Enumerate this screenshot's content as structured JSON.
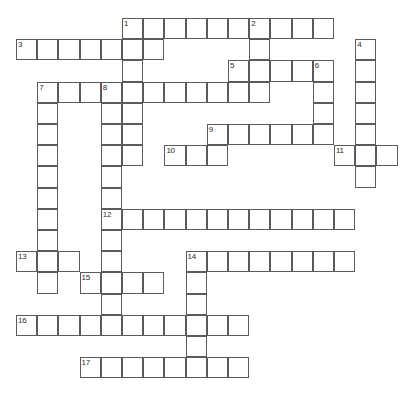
{
  "puzzle": {
    "kind": "crossword-grid",
    "title": "Crossword Puzzle Grid",
    "cell_size": 21.2,
    "origin_x": 16,
    "origin_y": 18,
    "grid_cols": 19,
    "grid_rows": 17,
    "cell_border_color": "#5b5b5b",
    "cell_fill_color": "#ffffff",
    "background_color": "#ffffff",
    "number_color": "#2b2b2b",
    "entries": [
      {
        "number": "1",
        "direction": "across",
        "col": 5,
        "row": 0,
        "length": 10
      },
      {
        "number": "1",
        "direction": "down",
        "col": 5,
        "row": 0,
        "length": 7
      },
      {
        "number": "2",
        "direction": "down",
        "col": 11,
        "row": 0,
        "length": 4
      },
      {
        "number": "3",
        "direction": "across",
        "col": 0,
        "row": 1,
        "length": 7
      },
      {
        "number": "4",
        "direction": "down",
        "col": 16,
        "row": 1,
        "length": 7
      },
      {
        "number": "5",
        "direction": "across",
        "col": 10,
        "row": 2,
        "length": 5
      },
      {
        "number": "6",
        "direction": "down",
        "col": 14,
        "row": 2,
        "length": 3
      },
      {
        "number": "7",
        "direction": "across",
        "col": 1,
        "row": 3,
        "length": 11
      },
      {
        "number": "7",
        "direction": "down",
        "col": 1,
        "row": 3,
        "length": 10
      },
      {
        "number": "8",
        "direction": "down",
        "col": 4,
        "row": 3,
        "length": 12
      },
      {
        "number": "9",
        "direction": "across",
        "col": 9,
        "row": 5,
        "length": 6
      },
      {
        "number": "10",
        "direction": "across",
        "col": 7,
        "row": 6,
        "length": 3
      },
      {
        "number": "11",
        "direction": "across",
        "col": 15,
        "row": 6,
        "length": 3
      },
      {
        "number": "12",
        "direction": "across",
        "col": 4,
        "row": 9,
        "length": 12
      },
      {
        "number": "13",
        "direction": "across",
        "col": 0,
        "row": 11,
        "length": 3
      },
      {
        "number": "14",
        "direction": "across",
        "col": 8,
        "row": 11,
        "length": 8
      },
      {
        "number": "14",
        "direction": "down",
        "col": 8,
        "row": 11,
        "length": 6
      },
      {
        "number": "15",
        "direction": "across",
        "col": 3,
        "row": 12,
        "length": 4
      },
      {
        "number": "16",
        "direction": "across",
        "col": 0,
        "row": 14,
        "length": 11
      },
      {
        "number": "17",
        "direction": "across",
        "col": 3,
        "row": 16,
        "length": 8
      }
    ],
    "numbers_visible": [
      "1",
      "2",
      "3",
      "4",
      "5",
      "6",
      "7",
      "8",
      "9",
      "10",
      "11",
      "12",
      "13",
      "14",
      "15",
      "16",
      "17"
    ]
  }
}
